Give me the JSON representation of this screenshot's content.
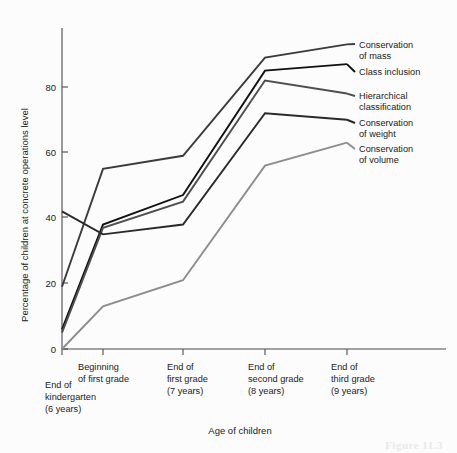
{
  "figure": {
    "caption_fragment": "Figure 11.3"
  },
  "chart_data": {
    "type": "line",
    "title": "",
    "xlabel": "Age of children",
    "ylabel": "Percentage of children at concrete operations level",
    "categories": [
      "End of kindergarten (6 years)",
      "Beginning of first grade",
      "End of first grade (7 years)",
      "End of second grade (8 years)",
      "End of third grade (9 years)"
    ],
    "category_lines": [
      [
        "End of",
        "kindergarten",
        "(6 years)"
      ],
      [
        "Beginning",
        "of first grade"
      ],
      [
        "End of",
        "first grade",
        "(7 years)"
      ],
      [
        "End of",
        "second grade",
        "(8 years)"
      ],
      [
        "End of",
        "third grade",
        "(9 years)"
      ]
    ],
    "ylim": [
      0,
      95
    ],
    "yticks": [
      0,
      20,
      40,
      60,
      80
    ],
    "ytick_labels": [
      "0",
      "20",
      "40",
      "60",
      "80"
    ],
    "grid": false,
    "legend_position": "right-inline-labels",
    "series": [
      {
        "name": "Conservation of mass",
        "label_lines": [
          "Conservation",
          "of mass"
        ],
        "color": "#3b3b3b",
        "values": [
          19,
          55,
          59,
          89,
          93
        ]
      },
      {
        "name": "Class inclusion",
        "label_lines": [
          "Class inclusion"
        ],
        "color": "#111111",
        "values": [
          6,
          38,
          47,
          85,
          87
        ]
      },
      {
        "name": "Hierarchical classification",
        "label_lines": [
          "Hierarchical",
          "classification"
        ],
        "color": "#4f4f4f",
        "values": [
          5,
          37,
          45,
          82,
          78
        ]
      },
      {
        "name": "Conservation of weight",
        "label_lines": [
          "Conservation",
          "of weight"
        ],
        "color": "#2a2a2a",
        "values": [
          42,
          35,
          38,
          72,
          70
        ]
      },
      {
        "name": "Conservation of volume",
        "label_lines": [
          "Conservation",
          "of volume"
        ],
        "color": "#8d8d8d",
        "values": [
          0,
          13,
          21,
          56,
          63
        ]
      }
    ]
  }
}
